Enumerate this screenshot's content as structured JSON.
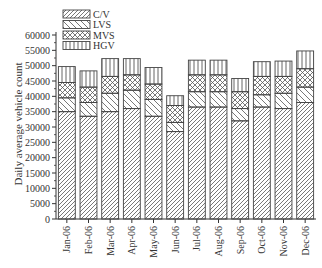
{
  "chart_data": {
    "type": "bar",
    "stacked": true,
    "title": "",
    "xlabel": "",
    "ylabel": "Daily average vehicle count",
    "ylim": [
      0,
      60000
    ],
    "yticks": [
      0,
      5000,
      10000,
      15000,
      20000,
      25000,
      30000,
      35000,
      40000,
      45000,
      50000,
      55000,
      60000
    ],
    "categories": [
      "Jan-06",
      "Feb-06",
      "Mar-06",
      "Apr-06",
      "May-06",
      "Jun-06",
      "Jul-06",
      "Aug-06",
      "Sep-06",
      "Oct-06",
      "Nov-06",
      "Dec-06"
    ],
    "series": [
      {
        "name": "C/V",
        "pattern": "forward-diagonal",
        "values": [
          35000,
          33500,
          35000,
          36000,
          33500,
          28500,
          36500,
          36500,
          32000,
          36500,
          36000,
          38000
        ]
      },
      {
        "name": "LVS",
        "pattern": "back-diagonal",
        "values": [
          4500,
          4500,
          6000,
          6000,
          5500,
          3000,
          5000,
          5000,
          4000,
          4000,
          5000,
          5000
        ]
      },
      {
        "name": "MVS",
        "pattern": "crosshatch",
        "values": [
          5000,
          5000,
          5500,
          5000,
          5000,
          5500,
          5500,
          5500,
          5500,
          6000,
          5500,
          6000
        ]
      },
      {
        "name": "HGV",
        "pattern": "vertical",
        "values": [
          5200,
          5300,
          5800,
          5300,
          5400,
          3200,
          4800,
          4800,
          4300,
          4800,
          5000,
          5800
        ]
      }
    ],
    "legend_position": "top-left-inside",
    "grid": false
  }
}
